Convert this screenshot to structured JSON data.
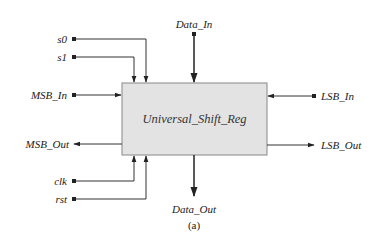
{
  "diagram": {
    "block": {
      "label": "Universal_Shift_Reg",
      "fill": "#e3e3e3",
      "border": "#888888"
    },
    "ports": {
      "s0": "s0",
      "s1": "s1",
      "msb_in": "MSB_In",
      "msb_out": "MSB_Out",
      "clk": "clk",
      "rst": "rst",
      "data_in": "Data_In",
      "data_out": "Data_Out",
      "lsb_in": "LSB_In",
      "lsb_out": "LSB_Out"
    },
    "caption": "(a)"
  }
}
